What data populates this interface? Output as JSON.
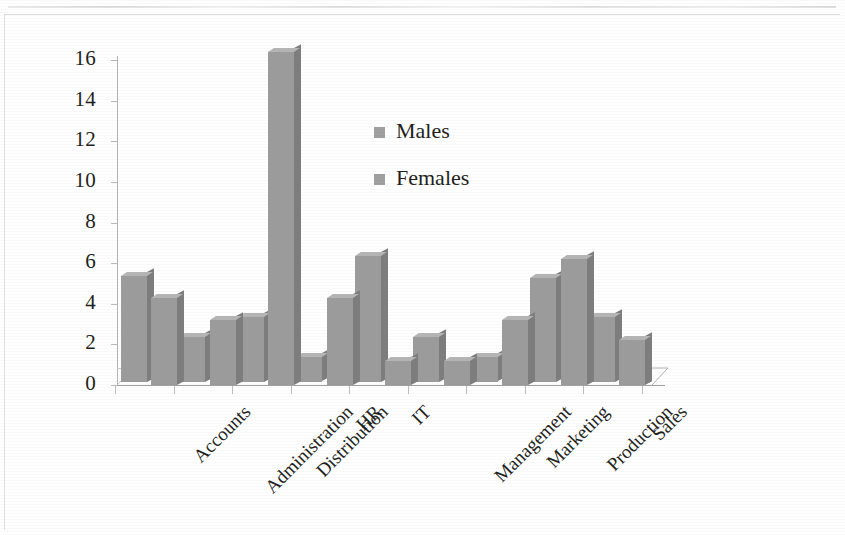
{
  "chart_data": {
    "type": "bar",
    "title": "",
    "subtitle": "",
    "xlabel": "",
    "ylabel": "",
    "categories": [
      "Accounts",
      "Administration",
      "Distribution",
      "HR",
      "IT",
      "Management",
      "Marketing",
      "Production",
      "Sales"
    ],
    "series": [
      {
        "name": "Males",
        "values": [
          5.2,
          2.2,
          3.2,
          1.2,
          6.2,
          2.2,
          1.2,
          5.1,
          3.2
        ]
      },
      {
        "name": "Females",
        "values": [
          4.3,
          3.2,
          16.4,
          4.3,
          1.2,
          1.2,
          3.2,
          6.2,
          2.2
        ]
      }
    ],
    "ylim": [
      0,
      16
    ],
    "ytick_labels": [
      "16",
      "14",
      "12",
      "10",
      "8",
      "6",
      "4",
      "2",
      "0"
    ],
    "ytick_values": [
      16,
      14,
      12,
      10,
      8,
      6,
      4,
      2,
      0
    ],
    "ytick_step": 2,
    "grid": false,
    "legend_position": "inside-upper-center",
    "style": "3d-clustered-column",
    "label_rotation_deg": -45,
    "colors": {
      "bar_front": "#9b9b9b",
      "bar_side": "#7d7d7d",
      "bar_top": "#b4b4b4",
      "axis": "#b4b4b4",
      "floor": "#9f9f9f",
      "text": "#231f20",
      "background": "#ffffff",
      "legend_swatch": "#a0a0a0"
    }
  },
  "legend": {
    "items": [
      {
        "label": "Males"
      },
      {
        "label": "Females"
      }
    ]
  }
}
